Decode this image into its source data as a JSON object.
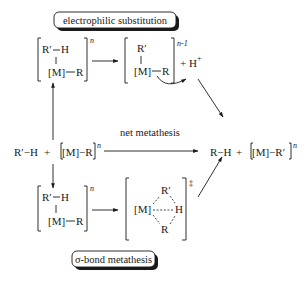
{
  "diagram": {
    "title_top": "electrophilic substitution",
    "title_bottom": "σ-bond metathesis",
    "net_label": "net metathesis",
    "reactants": {
      "r1": "R′−H",
      "plus": "+",
      "r2": "[M]−R",
      "charge": "n"
    },
    "products": {
      "p1": "R−H",
      "plus": "+",
      "p2": "[M]−R′",
      "charge": "n"
    },
    "es_adduct": {
      "top_left": "R′",
      "top_right": "H",
      "metal": "[M]",
      "r": "R",
      "charge": "n"
    },
    "es_intermediate": {
      "top": "R′",
      "metal": "[M]",
      "r": "R",
      "charge": "n-1",
      "proton": "+ H",
      "proton_charge": "+"
    },
    "sbm_adduct": {
      "top_left": "R′",
      "top_right": "H",
      "metal": "[M]",
      "r": "R",
      "charge": "n"
    },
    "sbm_ts": {
      "metal": "[M]",
      "top": "R′",
      "h": "H",
      "bottom": "R",
      "charge": "‡"
    }
  }
}
